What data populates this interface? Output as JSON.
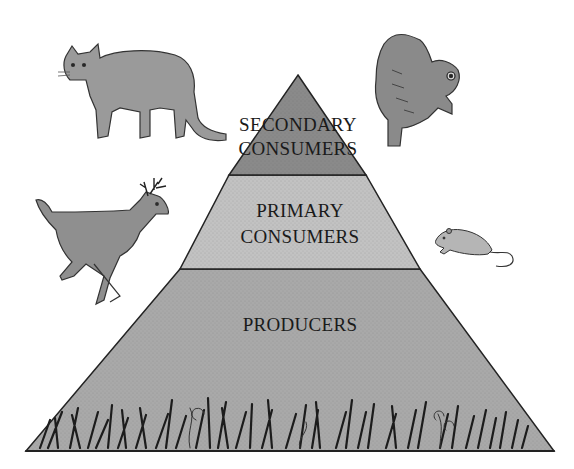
{
  "diagram": {
    "type": "ecological-pyramid",
    "tiers": [
      {
        "id": "secondary",
        "lines": [
          "SECONDARY",
          "CONSUMERS"
        ],
        "fill": "#8a8a8a"
      },
      {
        "id": "primary",
        "lines": [
          "PRIMARY",
          "CONSUMERS"
        ],
        "fill": "#c2c2c2"
      },
      {
        "id": "producers",
        "lines": [
          "PRODUCERS"
        ],
        "fill": "#a9a9a9"
      }
    ],
    "animals": [
      {
        "name": "mountain-lion",
        "tier": "secondary"
      },
      {
        "name": "owl",
        "tier": "secondary"
      },
      {
        "name": "deer",
        "tier": "primary"
      },
      {
        "name": "mouse",
        "tier": "primary"
      }
    ],
    "ground": "grass-and-plants",
    "colors": {
      "outline": "#222222",
      "background": "#ffffff",
      "animal": "#8c8c8c"
    }
  }
}
